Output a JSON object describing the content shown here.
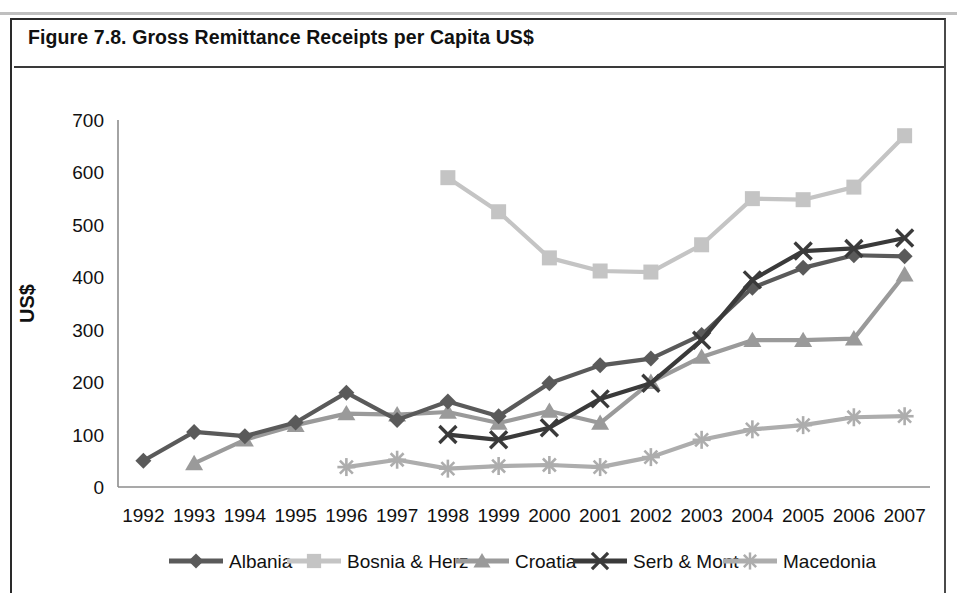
{
  "figure": {
    "title": "Figure 7.8. Gross Remittance Receipts per Capita US$"
  },
  "chart_data": {
    "type": "line",
    "title": "Figure 7.8. Gross Remittance Receipts per Capita US$",
    "xlabel": "",
    "ylabel": "US$",
    "x": [
      1992,
      1993,
      1994,
      1995,
      1996,
      1997,
      1998,
      1999,
      2000,
      2001,
      2002,
      2003,
      2004,
      2005,
      2006,
      2007
    ],
    "categories": [
      "1992",
      "1993",
      "1994",
      "1995",
      "1996",
      "1997",
      "1998",
      "1999",
      "2000",
      "2001",
      "2002",
      "2003",
      "2004",
      "2005",
      "2006",
      "2007"
    ],
    "ylim": [
      0,
      700
    ],
    "yticks": [
      0,
      100,
      200,
      300,
      400,
      500,
      600,
      700
    ],
    "ytick_labels": [
      "0",
      "100",
      "200",
      "300",
      "400",
      "500",
      "600",
      "700"
    ],
    "grid": false,
    "legend_position": "bottom",
    "series": [
      {
        "name": "Albania",
        "color": "#5a5a5a",
        "marker": "diamond",
        "values": [
          50,
          105,
          97,
          123,
          180,
          128,
          163,
          135,
          198,
          232,
          245,
          290,
          380,
          418,
          442,
          440
        ]
      },
      {
        "name": "Bosnia & Herz",
        "color": "#c4c4c4",
        "marker": "square",
        "values": [
          null,
          null,
          null,
          null,
          null,
          null,
          590,
          525,
          437,
          412,
          410,
          462,
          550,
          548,
          572,
          670
        ]
      },
      {
        "name": "Croatia",
        "color": "#9a9a9a",
        "marker": "triangle",
        "values": [
          null,
          45,
          90,
          118,
          140,
          138,
          143,
          122,
          145,
          122,
          200,
          248,
          280,
          280,
          283,
          405
        ]
      },
      {
        "name": "Serb & Mont",
        "color": "#3a3a3a",
        "marker": "x",
        "values": [
          null,
          null,
          null,
          null,
          null,
          null,
          100,
          90,
          113,
          168,
          198,
          280,
          395,
          450,
          455,
          475
        ]
      },
      {
        "name": "Macedonia",
        "color": "#adadad",
        "marker": "asterisk",
        "values": [
          null,
          null,
          null,
          null,
          38,
          52,
          35,
          40,
          42,
          38,
          57,
          90,
          110,
          118,
          133,
          135
        ]
      }
    ]
  },
  "legend": {
    "items": [
      {
        "label": "Albania",
        "color": "#5a5a5a",
        "marker": "diamond"
      },
      {
        "label": "Bosnia & Herz",
        "color": "#c4c4c4",
        "marker": "square"
      },
      {
        "label": "Croatia",
        "color": "#9a9a9a",
        "marker": "triangle"
      },
      {
        "label": "Serb & Mont",
        "color": "#3a3a3a",
        "marker": "x"
      },
      {
        "label": "Macedonia",
        "color": "#adadad",
        "marker": "asterisk"
      }
    ]
  },
  "axis": {
    "y_title": "US$"
  }
}
